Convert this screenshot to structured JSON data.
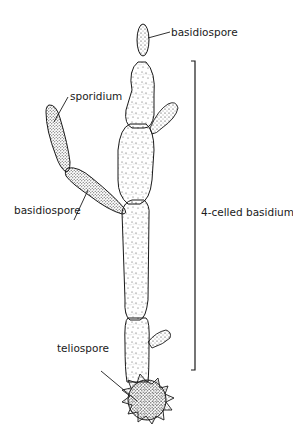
{
  "diagram": {
    "labels": {
      "basidiospore_top": "basidiospore",
      "sporidium": "sporidium",
      "basidiospore_left": "basidiospore",
      "four_celled_basidium": "4-celled basidium",
      "teliospore": "teliospore"
    },
    "colors": {
      "ink": "#1a1a1a",
      "background": "#ffffff"
    }
  }
}
